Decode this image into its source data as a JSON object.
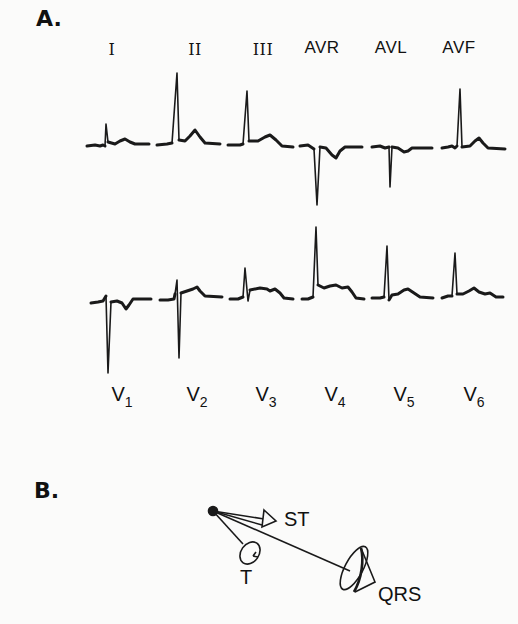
{
  "panel_a": {
    "label": "A.",
    "limb_leads": [
      {
        "name": "I",
        "x": 112
      },
      {
        "name": "II",
        "x": 183
      },
      {
        "name": "III",
        "x": 253
      },
      {
        "name": "AVR",
        "x": 322
      },
      {
        "name": "AVL",
        "x": 391
      },
      {
        "name": "AVF",
        "x": 459
      }
    ],
    "precordial_leads": [
      {
        "name": "V",
        "sub": "1",
        "x": 122
      },
      {
        "name": "V",
        "sub": "2",
        "x": 197
      },
      {
        "name": "V",
        "sub": "3",
        "x": 266
      },
      {
        "name": "V",
        "sub": "4",
        "x": 335
      },
      {
        "name": "V",
        "sub": "5",
        "x": 404
      },
      {
        "name": "V",
        "sub": "6",
        "x": 474
      }
    ]
  },
  "panel_b": {
    "label": "B.",
    "vectors": [
      {
        "name": "ST"
      },
      {
        "name": "T"
      },
      {
        "name": "QRS"
      }
    ]
  },
  "colors": {
    "ink": "#1a1a1a",
    "background": "#fbfbfa"
  }
}
